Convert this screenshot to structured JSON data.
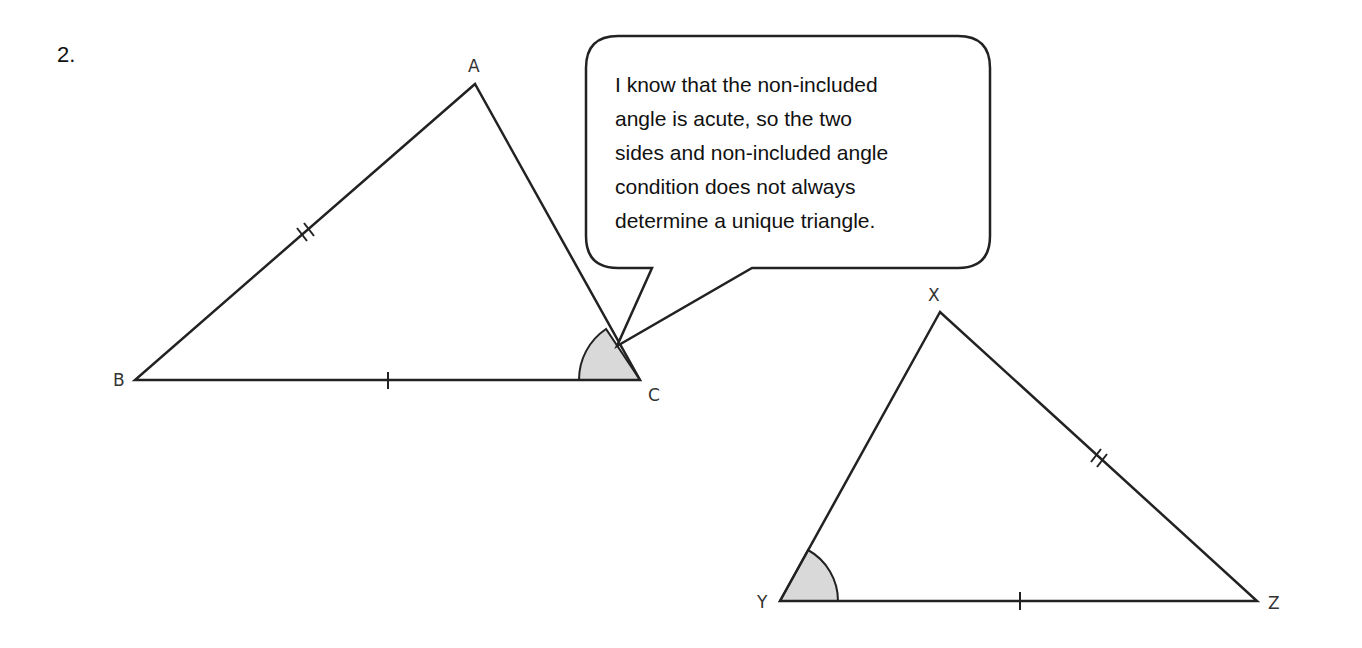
{
  "question": {
    "number": "2."
  },
  "speech_bubble": {
    "lines": [
      "I know that the non-included",
      "angle is acute, so the two",
      "sides and non-included angle",
      "condition does not always",
      "determine a unique triangle."
    ]
  },
  "triangle_abc": {
    "vertices": {
      "A": "A",
      "B": "B",
      "C": "C"
    },
    "marked_angle": "C",
    "tick_marks": {
      "AB": "double",
      "BC": "single"
    }
  },
  "triangle_xyz": {
    "vertices": {
      "X": "X",
      "Y": "Y",
      "Z": "Z"
    },
    "marked_angle": "Y",
    "tick_marks": {
      "XZ": "double",
      "YZ": "single"
    }
  },
  "colors": {
    "line": "#222222",
    "angle_fill": "#d9d9d9",
    "background": "#ffffff"
  }
}
